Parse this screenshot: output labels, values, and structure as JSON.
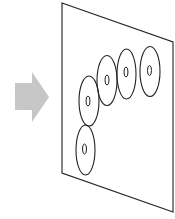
{
  "diagram": {
    "width": 175,
    "height": 219,
    "colors": {
      "background": "#ffffff",
      "stroke": "#222222",
      "arrow_fill": "#c8c8c8"
    },
    "arrow": {
      "direction": "right",
      "points": "15,83 32,83 32,72 49,97 32,122 32,110 15,110"
    },
    "plane": {
      "shape": "parallelogram",
      "points": "62,3 173,42 173,212 62,173"
    },
    "discs": [
      {
        "id": "disc-1",
        "cx": 89,
        "cy": 101,
        "rx": 10,
        "ry": 25,
        "inner": {
          "cx": 88,
          "cy": 101,
          "rx": 2,
          "ry": 5
        }
      },
      {
        "id": "disc-2",
        "cx": 107,
        "cy": 80.5,
        "rx": 10,
        "ry": 25,
        "inner": {
          "cx": 107,
          "cy": 80,
          "rx": 2,
          "ry": 5
        }
      },
      {
        "id": "disc-3",
        "cx": 126.5,
        "cy": 74,
        "rx": 9.5,
        "ry": 25,
        "inner": {
          "cx": 126,
          "cy": 72,
          "rx": 2,
          "ry": 5
        }
      },
      {
        "id": "disc-4",
        "cx": 150,
        "cy": 71.5,
        "rx": 10,
        "ry": 25,
        "inner": {
          "cx": 149.5,
          "cy": 70.5,
          "rx": 2,
          "ry": 5
        }
      },
      {
        "id": "disc-5",
        "cx": 85.5,
        "cy": 150,
        "rx": 9.5,
        "ry": 25,
        "inner": {
          "cx": 84.5,
          "cy": 149,
          "rx": 2,
          "ry": 5
        }
      }
    ]
  }
}
